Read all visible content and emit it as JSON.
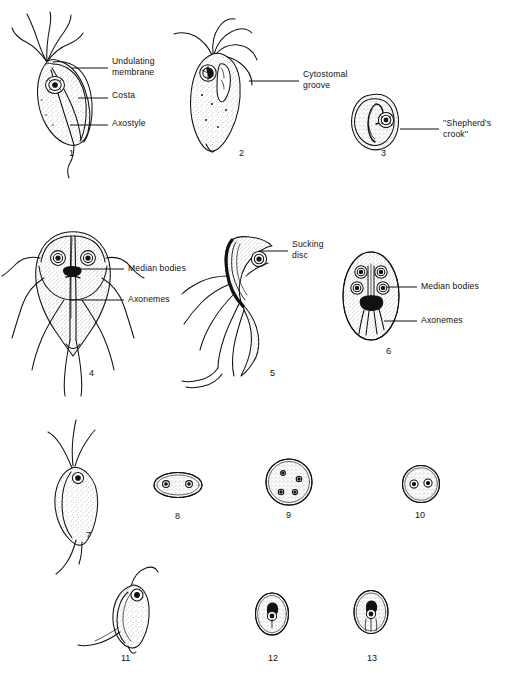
{
  "plate": {
    "title": "Flagellate protozoa plate",
    "background": "#ffffff",
    "ink": "#111111",
    "stipple": "#6a6a6a",
    "width": 512,
    "height": 681
  },
  "labels": [
    {
      "id": "undulating-membrane",
      "text": "Undulating\nmembrane",
      "x": 112,
      "y": 63,
      "leader_from_x": 108,
      "leader_from_y": 68,
      "leader_to_x": 72,
      "leader_to_y": 68
    },
    {
      "id": "costa",
      "text": "Costa",
      "x": 112,
      "y": 95,
      "leader_from_x": 108,
      "leader_from_y": 98,
      "leader_to_x": 78,
      "leader_to_y": 98
    },
    {
      "id": "axostyle",
      "text": "Axostyle",
      "x": 112,
      "y": 122,
      "leader_from_x": 108,
      "leader_from_y": 125,
      "leader_to_x": 70,
      "leader_to_y": 125
    },
    {
      "id": "cytostomal-groove",
      "text": "Cytostomal\ngroove",
      "x": 303,
      "y": 76,
      "leader_from_x": 299,
      "leader_from_y": 81,
      "leader_to_x": 249,
      "leader_to_y": 81
    },
    {
      "id": "shepherds-crook",
      "text": "''Shepherd's\ncrook''",
      "x": 443,
      "y": 124,
      "leader_from_x": 439,
      "leader_from_y": 129,
      "leader_to_x": 400,
      "leader_to_y": 129
    },
    {
      "id": "median-bodies-4",
      "text": "Median bodies",
      "x": 128,
      "y": 265,
      "leader_from_x": 124,
      "leader_from_y": 269,
      "leader_to_x": 75,
      "leader_to_y": 269
    },
    {
      "id": "axonemes-4",
      "text": "Axonemes",
      "x": 128,
      "y": 296,
      "leader_from_x": 124,
      "leader_from_y": 300,
      "leader_to_x": 70,
      "leader_to_y": 300
    },
    {
      "id": "sucking-disc",
      "text": "Sucking\ndisc",
      "x": 292,
      "y": 246,
      "leader_from_x": 288,
      "leader_from_y": 251,
      "leader_to_x": 259,
      "leader_to_y": 251
    },
    {
      "id": "median-bodies-6",
      "text": "Median bodies",
      "x": 421,
      "y": 283,
      "leader_from_x": 417,
      "leader_from_y": 287,
      "leader_to_x": 386,
      "leader_to_y": 287
    },
    {
      "id": "axonemes-6",
      "text": "Axonemes",
      "x": 421,
      "y": 317,
      "leader_from_x": 417,
      "leader_from_y": 321,
      "leader_to_x": 384,
      "leader_to_y": 321
    }
  ],
  "figures": [
    {
      "number": "1",
      "x": 69,
      "y": 155,
      "kind": "trichomonas-trophozoite"
    },
    {
      "number": "2",
      "x": 239,
      "y": 155,
      "kind": "chilomastix-trophozoite"
    },
    {
      "number": "3",
      "x": 381,
      "y": 155,
      "kind": "chilomastix-cyst"
    },
    {
      "number": "4",
      "x": 89,
      "y": 375,
      "kind": "giardia-trophozoite-frontal"
    },
    {
      "number": "5",
      "x": 270,
      "y": 375,
      "kind": "giardia-trophozoite-lateral"
    },
    {
      "number": "6",
      "x": 386,
      "y": 353,
      "kind": "giardia-cyst"
    },
    {
      "number": "7",
      "x": 86,
      "y": 537,
      "kind": "small-flagellate-trophozoite"
    },
    {
      "number": "8",
      "x": 178,
      "y": 518,
      "kind": "oval-cyst"
    },
    {
      "number": "9",
      "x": 289,
      "y": 517,
      "kind": "round-cyst-multinucleate"
    },
    {
      "number": "10",
      "x": 421,
      "y": 517,
      "kind": "round-cyst-binucleate"
    },
    {
      "number": "11",
      "x": 124,
      "y": 660,
      "kind": "chilomastix-trophozoite-small"
    },
    {
      "number": "12",
      "x": 271,
      "y": 660,
      "kind": "small-cyst-single"
    },
    {
      "number": "13",
      "x": 370,
      "y": 660,
      "kind": "small-cyst-single-striated"
    }
  ]
}
